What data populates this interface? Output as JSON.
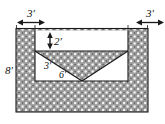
{
  "figure": {
    "kind": "cross-section-diagram",
    "background_color": "#ffffff",
    "line_color": "#1a1a1a",
    "fill_pattern": "stippled-ground-hatch",
    "fill_color": "#9a9a9a",
    "void_color": "#ffffff"
  },
  "labels": {
    "top_left_width": "3'",
    "top_right_width": "3'",
    "left_depth": "8'",
    "top_band_depth": "2'",
    "slope_height": "3'",
    "slope_run": "6'"
  },
  "dimensions": {
    "left_shoulder": 3,
    "right_shoulder": 3,
    "total_depth": 8,
    "upper_cut_depth": 2,
    "slope_rise": 3,
    "slope_run": 6,
    "units": "feet"
  },
  "arrows": {
    "top_left": "double-headed-horizontal-arrow",
    "top_right": "double-headed-horizontal-arrow",
    "top_band": "double-headed-vertical-arrow"
  }
}
